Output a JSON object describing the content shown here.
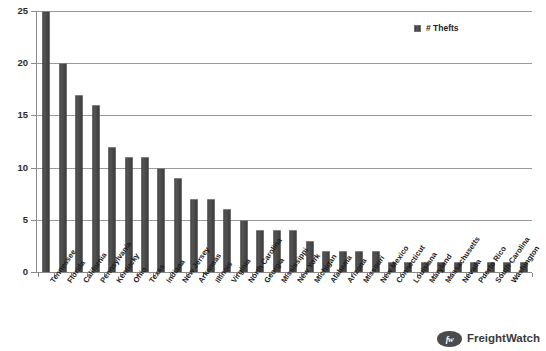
{
  "chart_data": {
    "type": "bar",
    "title": "",
    "xlabel": "",
    "ylabel": "",
    "ylim": [
      0,
      25
    ],
    "yticks": [
      0,
      5,
      10,
      15,
      20,
      25
    ],
    "grid": true,
    "legend_position": "top-right",
    "series": [
      {
        "name": "# Thefts",
        "color": "#464646",
        "values": [
          25,
          20,
          17,
          16,
          12,
          11,
          11,
          10,
          9,
          7,
          7,
          6,
          5,
          4,
          4,
          4,
          3,
          2,
          2,
          2,
          2,
          1,
          1,
          1,
          1,
          1,
          1,
          1,
          1,
          1
        ]
      }
    ],
    "categories": [
      "Tennessee",
      "Florida",
      "California",
      "Pennsylvania",
      "Kentucky",
      "Ohio",
      "Texas",
      "Indiana",
      "New Jersey",
      "Arkansas",
      "Illinois",
      "Virginia",
      "North Carolina",
      "Georgia",
      "Mississippi",
      "New York",
      "Michigan",
      "Alabama",
      "Arizona",
      "Missouri",
      "New Mexico",
      "Connecticut",
      "Louisiana",
      "Maryland",
      "Massachusetts",
      "Nevada",
      "Puerto Rico",
      "South Carolina",
      "Washington",
      ""
    ]
  },
  "legend": {
    "label": "# Thefts",
    "swatch_color": "#464646"
  },
  "yaxis": {
    "ticks": [
      "0",
      "5",
      "10",
      "15",
      "20",
      "25"
    ]
  },
  "brand": {
    "logo_text": "fw",
    "name": "FreightWatch"
  }
}
